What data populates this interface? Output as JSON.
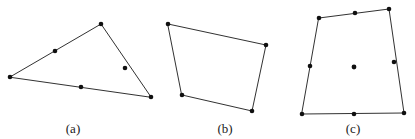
{
  "figure": {
    "width": 415,
    "height": 139,
    "background_color": "#ffffff",
    "stroke_color": "#1a1a1a",
    "dot_color": "#101010",
    "panels": [
      {
        "id": "a",
        "label": "(a)",
        "label_x": 73,
        "label_y": 133,
        "shape": "triangle",
        "closed": true,
        "outline": [
          {
            "x": 10,
            "y": 77
          },
          {
            "x": 101,
            "y": 24
          },
          {
            "x": 151,
            "y": 97
          }
        ],
        "marked_points": [
          {
            "x": 10,
            "y": 77,
            "kind": "vertex"
          },
          {
            "x": 55,
            "y": 51,
            "kind": "edge"
          },
          {
            "x": 101,
            "y": 24,
            "kind": "vertex"
          },
          {
            "x": 125,
            "y": 68,
            "kind": "edge"
          },
          {
            "x": 151,
            "y": 97,
            "kind": "vertex"
          },
          {
            "x": 81,
            "y": 87,
            "kind": "edge"
          }
        ]
      },
      {
        "id": "b",
        "label": "(b)",
        "label_x": 225,
        "label_y": 133,
        "shape": "quadrilateral",
        "closed": true,
        "outline": [
          {
            "x": 168,
            "y": 24
          },
          {
            "x": 266,
            "y": 45
          },
          {
            "x": 252,
            "y": 111
          },
          {
            "x": 182,
            "y": 95
          }
        ],
        "marked_points": [
          {
            "x": 168,
            "y": 24,
            "kind": "vertex"
          },
          {
            "x": 266,
            "y": 45,
            "kind": "vertex"
          },
          {
            "x": 252,
            "y": 111,
            "kind": "vertex"
          },
          {
            "x": 182,
            "y": 95,
            "kind": "vertex"
          }
        ]
      },
      {
        "id": "c",
        "label": "(c)",
        "label_x": 353,
        "label_y": 133,
        "shape": "quadrilateral",
        "closed": true,
        "outline": [
          {
            "x": 319,
            "y": 18
          },
          {
            "x": 389,
            "y": 9
          },
          {
            "x": 404,
            "y": 113
          },
          {
            "x": 302,
            "y": 114
          }
        ],
        "marked_points": [
          {
            "x": 319,
            "y": 18,
            "kind": "vertex"
          },
          {
            "x": 355,
            "y": 13,
            "kind": "edge"
          },
          {
            "x": 389,
            "y": 9,
            "kind": "vertex"
          },
          {
            "x": 394,
            "y": 62,
            "kind": "edge"
          },
          {
            "x": 404,
            "y": 113,
            "kind": "vertex"
          },
          {
            "x": 354,
            "y": 114,
            "kind": "edge"
          },
          {
            "x": 302,
            "y": 114,
            "kind": "vertex"
          },
          {
            "x": 310,
            "y": 66,
            "kind": "edge"
          },
          {
            "x": 354,
            "y": 67,
            "kind": "interior"
          }
        ]
      }
    ]
  }
}
